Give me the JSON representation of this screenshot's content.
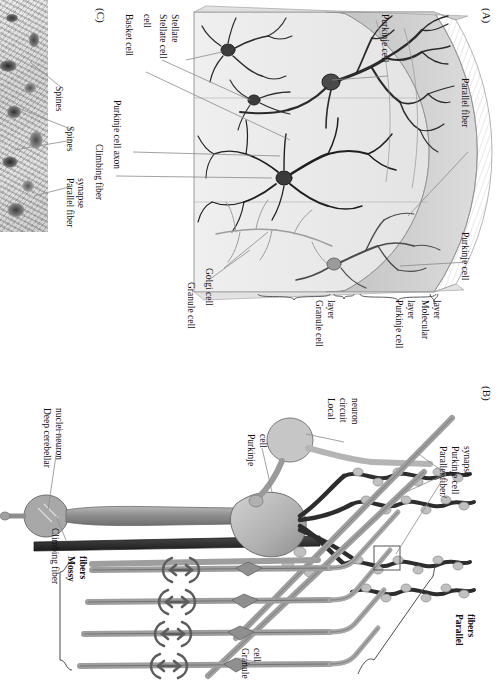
{
  "figure": {
    "orientation": "rotated-90-clockwise",
    "background": "#ffffff"
  },
  "panels": {
    "a": {
      "label": "(A)",
      "description": "Three-dimensional wedge of cerebellar cortex showing cell types and layers",
      "callouts": [
        {
          "id": "purkinje-cell-top",
          "text": "Purkinje cell"
        },
        {
          "id": "parallel-fiber",
          "text": "Parallel fiber"
        },
        {
          "id": "purkinje-cell-right",
          "text": "Purkinje cell"
        },
        {
          "id": "stellate-cell",
          "text": "Stellate\ncell"
        },
        {
          "id": "stellate-cell-l1",
          "text": "Stellate"
        },
        {
          "id": "stellate-cell-l2",
          "text": "cell"
        },
        {
          "id": "basket-cell",
          "text": "Basket cell"
        },
        {
          "id": "purkinje-cell-axon",
          "text": "Purkinje cell axon"
        },
        {
          "id": "climbing-fiber",
          "text": "Climbing fiber"
        },
        {
          "id": "golgi-cell",
          "text": "Golgi cell"
        },
        {
          "id": "granule-cell",
          "text": "Granule cell"
        },
        {
          "id": "mossy-fiber",
          "text": "Mossy fiber"
        }
      ],
      "layers": [
        {
          "id": "molecular-layer",
          "line1": "Molecular",
          "line2": "layer"
        },
        {
          "id": "purkinje-cell-layer",
          "line1": "Purkinje cell",
          "line2": "layer"
        },
        {
          "id": "granule-cell-layer",
          "line1": "Granule cell",
          "line2": "layer"
        }
      ]
    },
    "b": {
      "label": "(B)",
      "description": "Schematic circuit diagram of cerebellar cortical connections",
      "callouts": [
        {
          "id": "deep-cerebellar-nuclei-neuron",
          "line1": "Deep cerebellar",
          "line2": "nuclei neuron"
        },
        {
          "id": "climbing-fiber",
          "text": "Climbing fiber"
        },
        {
          "id": "mossy-fibers",
          "line1": "Mossy",
          "line2": "fibers",
          "bold": true
        },
        {
          "id": "purkinje-cell",
          "line1": "Purkinje",
          "line2": "cell"
        },
        {
          "id": "local-circuit-neuron",
          "line1": "Local",
          "line2": "circuit",
          "line3": "neuron"
        },
        {
          "id": "parallel-fiber-purkinje-synapse",
          "line1": "Parallel fiber/",
          "line2": "Purkinje cell",
          "line3": "synapse"
        },
        {
          "id": "parallel-fibers",
          "line1": "Parallel",
          "line2": "fibers",
          "bold": true
        },
        {
          "id": "granule-cell",
          "line1": "Granule",
          "line2": "cell"
        }
      ]
    },
    "c": {
      "label": "(C)",
      "description": "Electron micrograph of parallel fiber synapses on Purkinje cell dendritic spines",
      "callouts": [
        {
          "id": "spines",
          "text": "Spines"
        },
        {
          "id": "spines-2",
          "text": "Spines"
        },
        {
          "id": "parallel-fiber-synapse",
          "line1": "Parallel fiber",
          "line2": "synapse"
        }
      ]
    }
  },
  "colors": {
    "molecular_layer_fill": "#cfcfcf",
    "purkinje_layer_band": "#a9a9a9",
    "granule_layer_fill": "#e6e6e6",
    "wedge_face_top": "#d6d6d6",
    "neuron_dark": "#2a2a2a",
    "neuron_mid": "#6f6f6f",
    "fiber_gray": "#9a9a9a",
    "fiber_light": "#c3c3c3",
    "leader_line": "#8a8a8a",
    "text": "#111111",
    "em_background": "#c8c8c8"
  }
}
